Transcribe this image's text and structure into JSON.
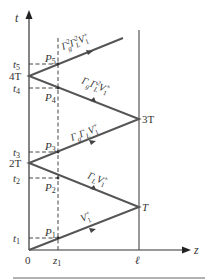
{
  "axes": {
    "t_label": "t",
    "z_label": "z",
    "origin_label": "0",
    "z1_label": "z",
    "z1_sub": "1",
    "ell_label": "ℓ"
  },
  "time_ticks": [
    {
      "label": "t",
      "sub": "1"
    },
    {
      "label": "t",
      "sub": "2"
    },
    {
      "label": "2T",
      "sub": ""
    },
    {
      "label": "t",
      "sub": "3"
    },
    {
      "label": "t",
      "sub": "4"
    },
    {
      "label": "4T",
      "sub": ""
    },
    {
      "label": "t",
      "sub": "5"
    }
  ],
  "turn_labels": {
    "T": "T",
    "3T": "3T"
  },
  "points": [
    {
      "label": "P",
      "sub": "1"
    },
    {
      "label": "P",
      "sub": "2"
    },
    {
      "label": "P",
      "sub": "3"
    },
    {
      "label": "P",
      "sub": "4"
    },
    {
      "label": "P",
      "sub": "5"
    }
  ],
  "segment_labels": [
    {
      "text": "V₁⁺"
    },
    {
      "text": "Γ_L V₁⁺",
      "g": "Γ",
      "gsub": "L",
      "v": "V",
      "vsub": "1",
      "vsup": "+"
    },
    {
      "text": "Γ_g Γ_L V₁⁺"
    },
    {
      "text": "Γ_g Γ_L² V₁⁺"
    },
    {
      "text": "Γ_g² Γ_L² V₁⁺"
    }
  ],
  "colors": {
    "zigzag": "#555555",
    "axis": "#333333",
    "dashed": "#444444",
    "rule": "#999999"
  }
}
